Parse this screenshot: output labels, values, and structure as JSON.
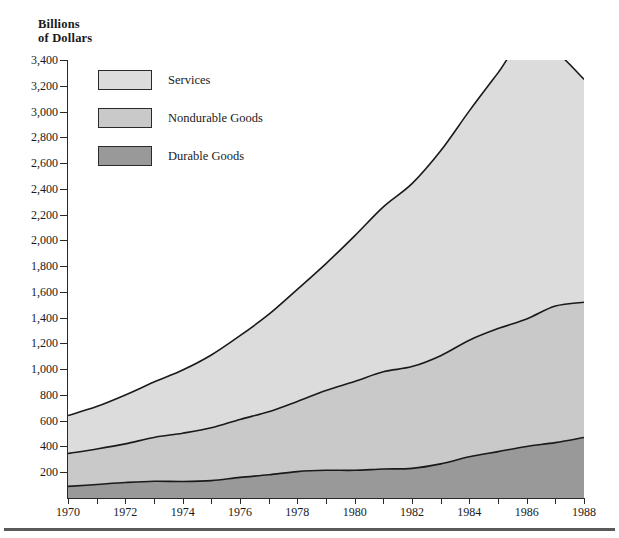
{
  "axis_title": "Billions\nof Dollars",
  "footer": {
    "rule": true
  },
  "legend": {
    "items": [
      {
        "label": "Services",
        "color": "#dcdcdc"
      },
      {
        "label": "Nondurable Goods",
        "color": "#c9c9c9"
      },
      {
        "label": "Durable Goods",
        "color": "#999999"
      }
    ]
  },
  "chart_data": {
    "type": "area",
    "stacked": true,
    "title": "",
    "xlabel": "",
    "ylabel": "Billions of Dollars",
    "xlim": [
      1970,
      1988
    ],
    "ylim": [
      0,
      3400
    ],
    "grid": false,
    "legend_position": "inside-top-left",
    "x": [
      1970,
      1971,
      1972,
      1973,
      1974,
      1975,
      1976,
      1977,
      1978,
      1979,
      1980,
      1981,
      1982,
      1983,
      1984,
      1985,
      1986,
      1987,
      1988
    ],
    "xtick_labels": [
      "1970",
      "1972",
      "1974",
      "1976",
      "1978",
      "1980",
      "1982",
      "1984",
      "1986",
      "1988"
    ],
    "xtick_values": [
      1970,
      1972,
      1974,
      1976,
      1978,
      1980,
      1982,
      1984,
      1986,
      1988
    ],
    "ytick_labels": [
      "200",
      "400",
      "600",
      "800",
      "1,000",
      "1,200",
      "1,400",
      "1,600",
      "1,800",
      "2,000",
      "2,200",
      "2,400",
      "2,600",
      "2,800",
      "3,000",
      "3,200",
      "3,400"
    ],
    "ytick_values": [
      200,
      400,
      600,
      800,
      1000,
      1200,
      1400,
      1600,
      1800,
      2000,
      2200,
      2400,
      2600,
      2800,
      3000,
      3200,
      3400
    ],
    "series": [
      {
        "name": "Durable Goods",
        "color": "#999999",
        "values": [
          90,
          105,
          120,
          130,
          128,
          135,
          160,
          180,
          205,
          215,
          215,
          225,
          230,
          265,
          320,
          360,
          400,
          430,
          470
        ]
      },
      {
        "name": "Nondurable Goods",
        "color": "#c9c9c9",
        "values": [
          255,
          275,
          300,
          340,
          375,
          410,
          450,
          490,
          545,
          620,
          690,
          755,
          790,
          840,
          905,
          955,
          990,
          1060,
          1050
        ]
      },
      {
        "name": "Services",
        "color": "#dcdcdc",
        "values": [
          295,
          330,
          380,
          430,
          490,
          565,
          650,
          755,
          870,
          985,
          1130,
          1280,
          1420,
          1590,
          1780,
          1985,
          2200,
          1980,
          1730
        ]
      }
    ],
    "cumulative": {
      "durable": [
        90,
        105,
        120,
        130,
        128,
        135,
        160,
        180,
        205,
        215,
        215,
        225,
        230,
        265,
        320,
        360,
        400,
        430,
        470
      ],
      "nondurable": [
        345,
        380,
        420,
        470,
        503,
        545,
        610,
        670,
        750,
        835,
        905,
        980,
        1020,
        1105,
        1225,
        1315,
        1390,
        1490,
        1520
      ],
      "total": [
        640,
        710,
        800,
        900,
        993,
        1110,
        1260,
        1425,
        1620,
        1820,
        2035,
        2260,
        2440,
        2695,
        3005,
        3300,
        3590,
        3470,
        3250
      ]
    }
  }
}
